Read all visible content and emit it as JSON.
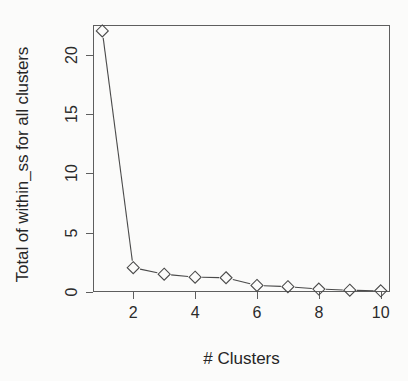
{
  "chart_data": {
    "type": "line",
    "title": "",
    "subtitle": "",
    "xlabel": "# Clusters",
    "ylabel": "Total of within_ss for all clusters",
    "x": [
      1,
      2,
      3,
      4,
      5,
      6,
      7,
      8,
      9,
      10
    ],
    "values": [
      22.0,
      2.05,
      1.5,
      1.25,
      1.2,
      0.55,
      0.45,
      0.25,
      0.15,
      0.1
    ],
    "series": [
      {
        "name": "within_ss",
        "values": [
          22.0,
          2.05,
          1.5,
          1.25,
          1.2,
          0.55,
          0.45,
          0.25,
          0.15,
          0.1
        ]
      }
    ],
    "xlim": [
      0.7,
      10.3
    ],
    "ylim": [
      0,
      22.5
    ],
    "xticks": [
      2,
      4,
      6,
      8,
      10
    ],
    "xticklabels": [
      "2",
      "4",
      "6",
      "8",
      "10"
    ],
    "yticks": [
      0,
      5,
      10,
      15,
      20
    ],
    "yticklabels": [
      "0",
      "5",
      "10",
      "15",
      "20"
    ],
    "grid": false,
    "legend": null,
    "legend_position": "none",
    "marker": "diamond-open",
    "line_color": "#4a4a4a",
    "marker_color": "#4a4a4a",
    "marker_fill": "none",
    "axis_color": "#5e5e5e",
    "background": "#fbfbfa",
    "annotations": []
  }
}
